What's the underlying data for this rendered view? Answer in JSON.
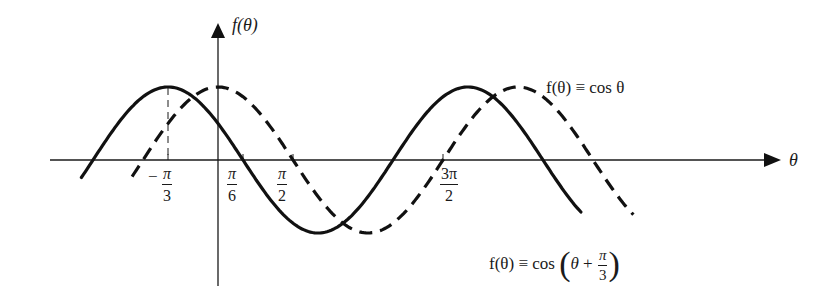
{
  "chart_data": {
    "type": "line",
    "title": "",
    "xlabel": "θ",
    "ylabel": "f(θ)",
    "grid": false,
    "axis_ranges": {
      "x_radians": [
        -2.86,
        2.98
      ],
      "x_units": "multiples of π approx [-0.95, 2.98]",
      "y": [
        -1.15,
        1.15
      ]
    },
    "x_ticks": [
      {
        "label": "-π/3",
        "value": -1.0472,
        "sign": "−",
        "num": "π",
        "den": "3",
        "dashed_guide_to_peak": true
      },
      {
        "label": "π/6",
        "value": 0.5236,
        "sign": "",
        "num": "π",
        "den": "6"
      },
      {
        "label": "π/2",
        "value": 1.5708,
        "sign": "",
        "num": "π",
        "den": "2"
      },
      {
        "label": "3π/2",
        "value": 4.7124,
        "sign": "",
        "num": "3π",
        "den": "2"
      }
    ],
    "series": [
      {
        "name": "f(θ) ≡ cos(θ + π/3)",
        "style": "solid",
        "phase_shift": -1.0472,
        "amplitude": 1,
        "x_range_radians": [
          -2.86,
          7.6
        ],
        "key_points": [
          {
            "theta": "-π/3",
            "y": 1,
            "type": "max"
          },
          {
            "theta": "π/6",
            "y": 0,
            "type": "zero"
          },
          {
            "theta": "2π/3",
            "y": -1,
            "type": "min"
          },
          {
            "theta": "7π/6",
            "y": 0,
            "type": "zero"
          },
          {
            "theta": "5π/3",
            "y": 1,
            "type": "max"
          },
          {
            "theta": "13π/6",
            "y": 0,
            "type": "zero"
          }
        ]
      },
      {
        "name": "f(θ) ≡ cos θ",
        "style": "dashed",
        "phase_shift": 0,
        "amplitude": 1,
        "x_range_radians": [
          -1.8,
          8.7
        ],
        "key_points": [
          {
            "theta": "0",
            "y": 1,
            "type": "max"
          },
          {
            "theta": "π/2",
            "y": 0,
            "type": "zero"
          },
          {
            "theta": "π",
            "y": -1,
            "type": "min"
          },
          {
            "theta": "3π/2",
            "y": 0,
            "type": "zero"
          },
          {
            "theta": "2π",
            "y": 1,
            "type": "max"
          },
          {
            "theta": "5π/2",
            "y": 0,
            "type": "zero"
          }
        ]
      }
    ],
    "annotations": [
      {
        "text": "f(θ) ≡ cos θ",
        "attached_to": "dashed"
      },
      {
        "text": "f(θ) ≡ cos (θ + π/3)",
        "attached_to": "solid"
      }
    ]
  },
  "labels": {
    "y_axis": "f(θ)",
    "x_axis": "θ",
    "legend_dashed": "f(θ) ≡ cos θ",
    "legend_solid_prefix": "f(θ) ≡ cos",
    "legend_solid_theta": "θ",
    "legend_solid_plus": "+",
    "legend_solid_num": "π",
    "legend_solid_den": "3",
    "paren_open": "(",
    "paren_close": ")",
    "tick_neg_pi_3_sign": "−",
    "tick_neg_pi_3_num": "π",
    "tick_neg_pi_3_den": "3",
    "tick_pi_6_num": "π",
    "tick_pi_6_den": "6",
    "tick_pi_2_num": "π",
    "tick_pi_2_den": "2",
    "tick_3pi_2_num": "3π",
    "tick_3pi_2_den": "2"
  },
  "geometry": {
    "origin_x": 218,
    "axis_y": 160,
    "px_per_pi": 150,
    "amplitude_px": 73,
    "line_color": "#1a1a1a"
  }
}
